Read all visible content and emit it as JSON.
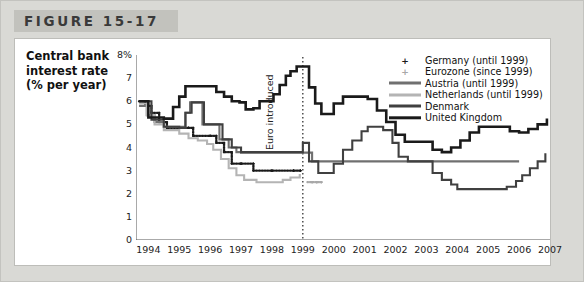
{
  "figure": {
    "title": "FIGURE 15-17",
    "axis_title_lines": [
      "Central bank",
      "interest rate",
      "(% per year)"
    ]
  },
  "annotation": {
    "euro_line_label": "Euro introduced"
  },
  "colors": {
    "card_background": "#d9d9d5",
    "title_bar": "#c2c2bd",
    "panel_background": "#ffffff",
    "germany": "#1a1a1a",
    "eurozone": "#a8a8a8",
    "austria": "#707070",
    "netherlands": "#b4b4b4",
    "denmark": "#404040",
    "united_kingdom": "#1a1a1a",
    "axis": "#555555"
  },
  "legend": {
    "position": "top-right",
    "entries": [
      {
        "label": "Germany (until 1999)",
        "marker": "cross",
        "color": "#1a1a1a",
        "width": 0
      },
      {
        "label": "Eurozone (since 1999)",
        "marker": "cross",
        "color": "#a8a8a8",
        "width": 0
      },
      {
        "label": "Austria (until 1999)",
        "marker": "line",
        "color": "#707070",
        "width": 3
      },
      {
        "label": "Netherlands (until 1999)",
        "marker": "line",
        "color": "#b4b4b4",
        "width": 3
      },
      {
        "label": "Denmark",
        "marker": "line",
        "color": "#404040",
        "width": 3
      },
      {
        "label": "United Kingdom",
        "marker": "line",
        "color": "#1a1a1a",
        "width": 3.4
      }
    ]
  },
  "chart_data": {
    "type": "line",
    "title": "FIGURE 15-17",
    "xlabel": "",
    "ylabel": "Central bank interest rate (% per year)",
    "xlim": [
      1993.6,
      2007.0
    ],
    "ylim": [
      0,
      8
    ],
    "yticks": [
      0,
      1,
      2,
      3,
      4,
      5,
      6,
      7,
      8
    ],
    "ytick_labels": [
      "0",
      "1",
      "2",
      "3",
      "4",
      "5",
      "6",
      "7",
      "8%"
    ],
    "xticks": [
      1994,
      1995,
      1996,
      1997,
      1998,
      1999,
      2000,
      2001,
      2002,
      2003,
      2004,
      2005,
      2006,
      2007
    ],
    "xtick_labels": [
      "1994",
      "1995",
      "1996",
      "1997",
      "1998",
      "1999",
      "2000",
      "2001",
      "2002",
      "2003",
      "2004",
      "2005",
      "2006",
      "2007"
    ],
    "grid": false,
    "annotations": [
      {
        "type": "vline",
        "x": 1999.0,
        "style": "dotted",
        "label": "Euro introduced"
      }
    ],
    "series": [
      {
        "name": "Germany (until 1999)",
        "color": "#1a1a1a",
        "style": "marker-cross",
        "points": [
          [
            1993.7,
            6.0
          ],
          [
            1993.9,
            5.8
          ],
          [
            1994.1,
            5.5
          ],
          [
            1994.35,
            5.1
          ],
          [
            1994.6,
            4.85
          ],
          [
            1995.0,
            4.85
          ],
          [
            1995.3,
            4.85
          ],
          [
            1995.45,
            4.5
          ],
          [
            1996.0,
            4.5
          ],
          [
            1996.2,
            4.2
          ],
          [
            1996.45,
            3.8
          ],
          [
            1996.7,
            3.3
          ],
          [
            1997.0,
            3.3
          ],
          [
            1997.4,
            3.0
          ],
          [
            1998.0,
            3.0
          ],
          [
            1998.7,
            3.0
          ],
          [
            1998.92,
            3.0
          ]
        ]
      },
      {
        "name": "Eurozone (since 1999)",
        "color": "#a8a8a8",
        "style": "marker-cross",
        "points": [
          [
            1999.15,
            2.5
          ],
          [
            1999.3,
            2.5
          ],
          [
            1999.45,
            2.5
          ],
          [
            1999.6,
            2.5
          ]
        ]
      },
      {
        "name": "Austria (until 1999)",
        "color": "#707070",
        "style": "line",
        "points": [
          [
            1993.7,
            5.8
          ],
          [
            1993.95,
            5.4
          ],
          [
            1994.2,
            5.1
          ],
          [
            1994.5,
            4.9
          ],
          [
            1995.0,
            4.9
          ],
          [
            1995.2,
            5.5
          ],
          [
            1995.35,
            5.95
          ],
          [
            1995.55,
            5.95
          ],
          [
            1995.75,
            5.0
          ],
          [
            1996.1,
            5.0
          ],
          [
            1996.3,
            4.35
          ],
          [
            1996.6,
            4.0
          ],
          [
            1996.85,
            3.8
          ],
          [
            1997.0,
            3.78
          ],
          [
            1998.0,
            3.78
          ],
          [
            1999.0,
            3.78
          ],
          [
            1999.3,
            3.4
          ],
          [
            2000.0,
            3.4
          ],
          [
            2001.0,
            3.4
          ],
          [
            2002.0,
            3.4
          ],
          [
            2003.0,
            3.4
          ],
          [
            2004.0,
            3.4
          ],
          [
            2005.0,
            3.4
          ],
          [
            2006.0,
            3.4
          ]
        ]
      },
      {
        "name": "Netherlands (until 1999)",
        "color": "#b4b4b4",
        "style": "line",
        "points": [
          [
            1993.7,
            5.9
          ],
          [
            1993.95,
            5.4
          ],
          [
            1994.2,
            5.0
          ],
          [
            1994.5,
            4.75
          ],
          [
            1995.0,
            4.6
          ],
          [
            1995.3,
            4.4
          ],
          [
            1995.6,
            4.3
          ],
          [
            1995.9,
            4.15
          ],
          [
            1996.1,
            3.9
          ],
          [
            1996.35,
            3.5
          ],
          [
            1996.6,
            3.1
          ],
          [
            1996.85,
            2.8
          ],
          [
            1997.1,
            2.6
          ],
          [
            1997.5,
            2.5
          ],
          [
            1998.0,
            2.5
          ],
          [
            1998.35,
            2.6
          ],
          [
            1998.6,
            2.7
          ],
          [
            1998.9,
            2.85
          ]
        ]
      },
      {
        "name": "Denmark",
        "color": "#404040",
        "style": "line",
        "points": [
          [
            1993.7,
            6.0
          ],
          [
            1994.1,
            5.2
          ],
          [
            1994.5,
            4.9
          ],
          [
            1995.0,
            4.85
          ],
          [
            1995.2,
            5.5
          ],
          [
            1995.4,
            5.95
          ],
          [
            1995.6,
            5.95
          ],
          [
            1995.8,
            5.0
          ],
          [
            1996.2,
            5.0
          ],
          [
            1996.4,
            4.35
          ],
          [
            1996.7,
            4.0
          ],
          [
            1997.0,
            3.8
          ],
          [
            1998.0,
            3.8
          ],
          [
            1998.5,
            3.8
          ],
          [
            1999.0,
            4.2
          ],
          [
            1999.2,
            3.4
          ],
          [
            1999.5,
            2.9
          ],
          [
            1999.8,
            2.9
          ],
          [
            2000.0,
            3.3
          ],
          [
            2000.3,
            3.9
          ],
          [
            2000.6,
            4.3
          ],
          [
            2000.9,
            4.7
          ],
          [
            2001.1,
            4.9
          ],
          [
            2001.4,
            4.9
          ],
          [
            2001.6,
            4.75
          ],
          [
            2001.9,
            4.2
          ],
          [
            2002.1,
            3.6
          ],
          [
            2002.4,
            3.4
          ],
          [
            2002.7,
            3.4
          ],
          [
            2003.0,
            3.4
          ],
          [
            2003.2,
            2.9
          ],
          [
            2003.5,
            2.6
          ],
          [
            2003.8,
            2.4
          ],
          [
            2004.0,
            2.2
          ],
          [
            2004.3,
            2.2
          ],
          [
            2004.6,
            2.2
          ],
          [
            2005.0,
            2.2
          ],
          [
            2005.3,
            2.2
          ],
          [
            2005.6,
            2.3
          ],
          [
            2005.9,
            2.55
          ],
          [
            2006.1,
            2.8
          ],
          [
            2006.35,
            3.1
          ],
          [
            2006.6,
            3.4
          ],
          [
            2006.85,
            3.75
          ]
        ]
      },
      {
        "name": "United Kingdom",
        "color": "#1a1a1a",
        "style": "line",
        "points": [
          [
            1993.7,
            6.0
          ],
          [
            1994.0,
            5.3
          ],
          [
            1994.5,
            5.25
          ],
          [
            1994.8,
            5.75
          ],
          [
            1995.0,
            6.2
          ],
          [
            1995.2,
            6.65
          ],
          [
            1995.6,
            6.65
          ],
          [
            1996.0,
            6.65
          ],
          [
            1996.2,
            6.4
          ],
          [
            1996.45,
            6.2
          ],
          [
            1996.7,
            6.0
          ],
          [
            1996.95,
            5.95
          ],
          [
            1997.15,
            5.65
          ],
          [
            1997.4,
            5.7
          ],
          [
            1997.6,
            6.0
          ],
          [
            1997.85,
            6.0
          ],
          [
            1998.05,
            6.3
          ],
          [
            1998.25,
            6.7
          ],
          [
            1998.45,
            7.1
          ],
          [
            1998.6,
            7.3
          ],
          [
            1998.8,
            7.5
          ],
          [
            1999.0,
            7.5
          ],
          [
            1999.2,
            6.6
          ],
          [
            1999.4,
            5.9
          ],
          [
            1999.6,
            5.45
          ],
          [
            1999.8,
            5.45
          ],
          [
            2000.0,
            5.9
          ],
          [
            2000.3,
            6.2
          ],
          [
            2000.6,
            6.2
          ],
          [
            2000.9,
            6.2
          ],
          [
            2001.1,
            6.1
          ],
          [
            2001.4,
            5.6
          ],
          [
            2001.7,
            5.1
          ],
          [
            2002.0,
            4.55
          ],
          [
            2002.3,
            4.25
          ],
          [
            2002.6,
            4.25
          ],
          [
            2003.0,
            4.25
          ],
          [
            2003.2,
            3.9
          ],
          [
            2003.5,
            3.8
          ],
          [
            2003.8,
            4.0
          ],
          [
            2004.1,
            4.3
          ],
          [
            2004.4,
            4.65
          ],
          [
            2004.7,
            4.9
          ],
          [
            2005.0,
            4.9
          ],
          [
            2005.4,
            4.9
          ],
          [
            2005.7,
            4.7
          ],
          [
            2006.0,
            4.65
          ],
          [
            2006.3,
            4.8
          ],
          [
            2006.6,
            5.0
          ],
          [
            2006.9,
            5.25
          ]
        ]
      }
    ]
  }
}
